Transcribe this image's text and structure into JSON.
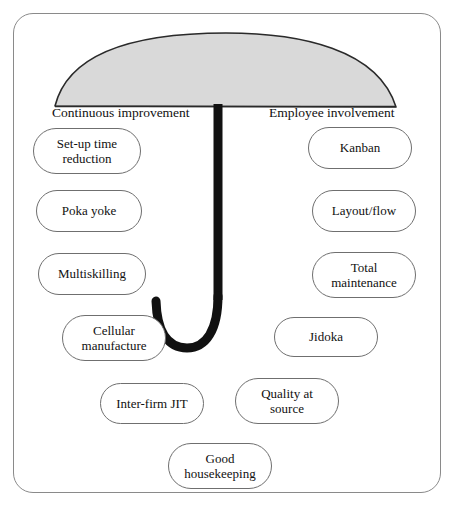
{
  "diagram": {
    "frame": {
      "border_color": "#8a8a8a"
    },
    "umbrella": {
      "canopy_fill": "#d9d9d9",
      "canopy_stroke": "#2a2a2a",
      "handle_color": "#111111",
      "name": "umbrella"
    },
    "axis_labels": {
      "left": "Continuous improvement",
      "right": "Employee involvement"
    },
    "elements": {
      "left_column": [
        {
          "id": "setup-time-reduction",
          "line1": "Set-up time",
          "line2": "reduction"
        },
        {
          "id": "poka-yoke",
          "line1": "Poka yoke",
          "line2": ""
        },
        {
          "id": "multiskilling",
          "line1": "Multiskilling",
          "line2": ""
        },
        {
          "id": "cellular-manufacture",
          "line1": "Cellular",
          "line2": "manufacture"
        }
      ],
      "right_column": [
        {
          "id": "kanban",
          "line1": "Kanban",
          "line2": ""
        },
        {
          "id": "layout-flow",
          "line1": "Layout/flow",
          "line2": ""
        },
        {
          "id": "total-maintenance",
          "line1": "Total",
          "line2": "maintenance"
        },
        {
          "id": "jidoka",
          "line1": "Jidoka",
          "line2": ""
        }
      ],
      "bottom_row": [
        {
          "id": "inter-firm-jit",
          "line1": "Inter-firm JIT",
          "line2": ""
        },
        {
          "id": "quality-at-source",
          "line1": "Quality at",
          "line2": "source"
        },
        {
          "id": "good-housekeeping",
          "line1": "Good",
          "line2": "housekeeping"
        }
      ]
    }
  }
}
